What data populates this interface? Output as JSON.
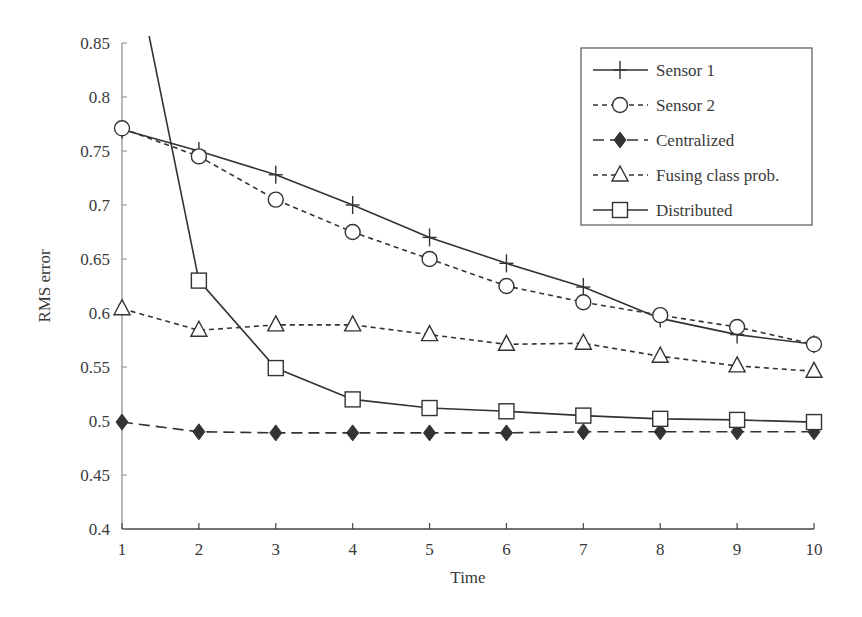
{
  "chart_data": {
    "type": "line",
    "title": "",
    "xlabel": "Time",
    "ylabel": "RMS error",
    "x": [
      1,
      2,
      3,
      4,
      5,
      6,
      7,
      8,
      9,
      10
    ],
    "xlim": [
      1,
      10
    ],
    "ylim": [
      0.4,
      0.85
    ],
    "x_ticks": [
      "1",
      "2",
      "3",
      "4",
      "5",
      "6",
      "7",
      "8",
      "9",
      "10"
    ],
    "y_ticks": [
      "0.4",
      "0.45",
      "0.5",
      "0.55",
      "0.6",
      "0.65",
      "0.7",
      "0.75",
      "0.8",
      "0.85"
    ],
    "grid": false,
    "legend_position": "upper right",
    "series": [
      {
        "name": "Sensor 1",
        "marker": "plus",
        "line": "solid",
        "values": [
          0.77,
          0.75,
          0.728,
          0.7,
          0.67,
          0.646,
          0.624,
          0.595,
          0.58,
          0.571
        ]
      },
      {
        "name": "Sensor 2",
        "marker": "circle",
        "line": "dashed",
        "values": [
          0.771,
          0.745,
          0.705,
          0.675,
          0.65,
          0.625,
          0.61,
          0.598,
          0.587,
          0.571
        ]
      },
      {
        "name": "Centralized",
        "marker": "filled-diamond",
        "line": "long-dash",
        "values": [
          0.499,
          0.49,
          0.489,
          0.489,
          0.489,
          0.489,
          0.49,
          0.49,
          0.49,
          0.49
        ]
      },
      {
        "name": "Fusing class prob.",
        "marker": "triangle",
        "line": "dashed",
        "values": [
          0.604,
          0.584,
          0.589,
          0.589,
          0.58,
          0.571,
          0.572,
          0.56,
          0.551,
          0.546
        ]
      },
      {
        "name": "Distributed",
        "marker": "square",
        "line": "solid",
        "values": [
          0.98,
          0.63,
          0.549,
          0.52,
          0.512,
          0.509,
          0.505,
          0.502,
          0.501,
          0.499
        ]
      }
    ]
  },
  "legend": {
    "items": [
      {
        "label": "Sensor 1"
      },
      {
        "label": "Sensor 2"
      },
      {
        "label": "Centralized"
      },
      {
        "label": "Fusing class prob."
      },
      {
        "label": "Distributed"
      }
    ]
  },
  "colors": {
    "ink": "#333333",
    "axis": "#555555",
    "background": "#ffffff"
  }
}
